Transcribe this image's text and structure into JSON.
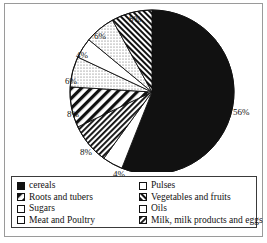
{
  "chart_data": {
    "type": "pie",
    "title": "",
    "start_angle_deg": -90,
    "direction": "clockwise",
    "categories": [
      "cereals",
      "Pulses",
      "Milk, milk products and eggs",
      "Roots and tubers",
      "Sugars",
      "Oils",
      "Meat and Poultry",
      "Sugars",
      "Vegetables and fruits"
    ],
    "values": [
      56,
      4,
      8,
      8,
      6,
      4,
      6,
      0,
      8
    ],
    "slices": [
      {
        "label": "cereals",
        "value": 56,
        "display": "56%",
        "pattern": "solid-black",
        "label_x": 228,
        "label_y": 104
      },
      {
        "label": "Pulses",
        "value": 4,
        "display": "4%",
        "pattern": "white",
        "label_x": 108,
        "label_y": 166
      },
      {
        "label": "Milk, milk products and eggs",
        "value": 8,
        "display": "8%",
        "pattern": "hatch-dense",
        "label_x": 75,
        "label_y": 144
      },
      {
        "label": "Roots and tubers",
        "value": 8,
        "display": "8%",
        "pattern": "hatch-wide",
        "label_x": 62,
        "label_y": 106
      },
      {
        "label": "Sugars",
        "value": 6,
        "display": "6%",
        "pattern": "dotted",
        "label_x": 60,
        "label_y": 73
      },
      {
        "label": "Oils",
        "value": 4,
        "display": "4%",
        "pattern": "white",
        "label_x": 71,
        "label_y": 47
      },
      {
        "label": "Meat and Poultry",
        "value": 6,
        "display": "6%",
        "pattern": "dotted",
        "label_x": 89,
        "label_y": 28
      },
      {
        "label": "Vegetables and fruits",
        "value": 8,
        "display": "8%",
        "pattern": "hatch-diag-dense",
        "label_x": 124,
        "label_y": 11
      }
    ],
    "ylabel": "",
    "xlabel": "",
    "legend_position": "bottom"
  },
  "legend": {
    "items": [
      {
        "label": "cereals",
        "pattern": "solid-black"
      },
      {
        "label": "Pulses",
        "pattern": "white"
      },
      {
        "label": "Roots and tubers",
        "pattern": "hatch-wide"
      },
      {
        "label": "Vegetables and fruits",
        "pattern": "hatch-diag-dense"
      },
      {
        "label": "Sugars",
        "pattern": "white"
      },
      {
        "label": "Oils",
        "pattern": "white"
      },
      {
        "label": "Meat and Poultry",
        "pattern": "white"
      },
      {
        "label": "Milk, milk products and eggs",
        "pattern": "hatch-dense"
      }
    ]
  },
  "colors": {
    "ink": "#111111",
    "frame": "#9a9a9a",
    "legend_border": "#3a3a3a",
    "background": "#ffffff"
  }
}
